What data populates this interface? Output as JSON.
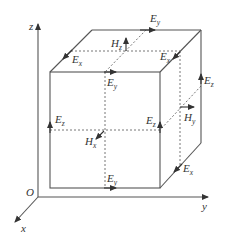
{
  "figure": {
    "type": "cube field-component diagram (Yee cell)",
    "axes": {
      "origin": "O",
      "x": "x",
      "y": "y",
      "z": "z"
    },
    "electric_field_labels": [
      {
        "id": "ey_top_back",
        "base": "E",
        "sub": "y"
      },
      {
        "id": "ex_top_left",
        "base": "E",
        "sub": "x"
      },
      {
        "id": "ex_top_right",
        "base": "E",
        "sub": "x"
      },
      {
        "id": "ey_top_front",
        "base": "E",
        "sub": "y"
      },
      {
        "id": "ez_back_right",
        "base": "E",
        "sub": "z"
      },
      {
        "id": "ez_front_left",
        "base": "E",
        "sub": "z"
      },
      {
        "id": "ez_front_right",
        "base": "E",
        "sub": "z"
      },
      {
        "id": "ey_bottom_front",
        "base": "E",
        "sub": "y"
      },
      {
        "id": "ex_bottom_right",
        "base": "E",
        "sub": "x"
      }
    ],
    "magnetic_field_labels": [
      {
        "id": "hz_top",
        "base": "H",
        "sub": "z"
      },
      {
        "id": "hx_front",
        "base": "H",
        "sub": "x"
      },
      {
        "id": "hy_right",
        "base": "H",
        "sub": "y"
      }
    ],
    "colors": {
      "line": "#555555",
      "dashed": "#666666",
      "text": "#333333"
    }
  }
}
